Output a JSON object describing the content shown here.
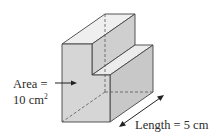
{
  "diagram": {
    "type": "3d-prism",
    "shape": "L-shaped cross-section prism (step profile)",
    "area_label": {
      "line1": "Area =",
      "value": "10 cm",
      "superscript": "2"
    },
    "length_label": "Length = 5 cm",
    "colors": {
      "front_face": "#d4d4d4",
      "top_face": "#eeeeee",
      "side_face": "#c6c6c6",
      "edge": "#444444",
      "hidden_edge": "#555555",
      "text": "#2b2b2b"
    }
  }
}
